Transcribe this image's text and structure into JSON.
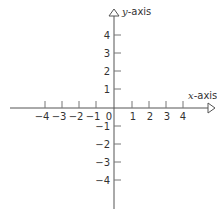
{
  "diagram": {
    "type": "cartesian-coordinate-plane",
    "x_axis": {
      "label_var": "x",
      "label_suffix": "-axis",
      "ticks": [
        {
          "value": -4,
          "label": "−4"
        },
        {
          "value": -3,
          "label": "−3"
        },
        {
          "value": -2,
          "label": "−2"
        },
        {
          "value": -1,
          "label": "−1"
        },
        {
          "value": 1,
          "label": "1"
        },
        {
          "value": 2,
          "label": "2"
        },
        {
          "value": 3,
          "label": "3"
        },
        {
          "value": 4,
          "label": "4"
        }
      ]
    },
    "y_axis": {
      "label_var": "y",
      "label_suffix": "-axis",
      "ticks": [
        {
          "value": 4,
          "label": "4"
        },
        {
          "value": 3,
          "label": "3"
        },
        {
          "value": 2,
          "label": "2"
        },
        {
          "value": 1,
          "label": "1"
        },
        {
          "value": -1,
          "label": "−1"
        },
        {
          "value": -2,
          "label": "−2"
        },
        {
          "value": -3,
          "label": "−3"
        },
        {
          "value": -4,
          "label": "−4"
        }
      ]
    },
    "origin_label": "0",
    "colors": {
      "line": "#555555",
      "text": "#333333",
      "background": "#ffffff"
    }
  }
}
